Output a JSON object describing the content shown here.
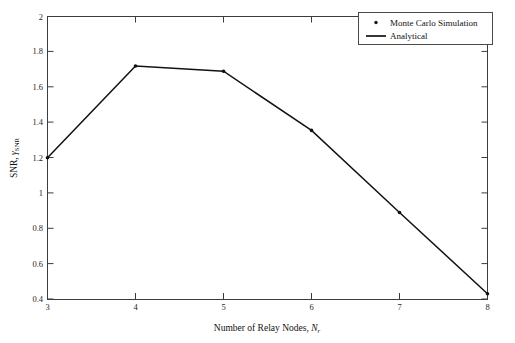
{
  "chart_data": {
    "type": "line",
    "title": "",
    "xlabel": "Number of Relay Nodes, N_r",
    "xlabel_main": "Number of Relay Nodes, ",
    "xlabel_symbol": "N",
    "xlabel_symbol_sub": "r",
    "ylabel": "SNR, γ_SNR",
    "ylabel_main": "SNR, ",
    "ylabel_symbol": "γ",
    "ylabel_symbol_sub": "SNR",
    "x": [
      3,
      4,
      5,
      6,
      7,
      8
    ],
    "xlim": [
      3,
      8
    ],
    "ylim": [
      0.4,
      2
    ],
    "xticks": [
      "3",
      "4",
      "5",
      "6",
      "7",
      "8"
    ],
    "yticks": [
      "0.4",
      "0.6",
      "0.8",
      "1",
      "1.2",
      "1.4",
      "1.6",
      "1.8",
      "2"
    ],
    "ytick_values": [
      0.4,
      0.6,
      0.8,
      1.0,
      1.2,
      1.4,
      1.6,
      1.8,
      2.0
    ],
    "grid": false,
    "legend_position": "top-right",
    "series": [
      {
        "name": "Monte Carlo Simulation",
        "style": "marker",
        "marker": "dot",
        "color": "#111111",
        "values": [
          1.2,
          1.72,
          1.69,
          1.355,
          0.89,
          0.43
        ]
      },
      {
        "name": "Analytical",
        "style": "line",
        "color": "#121212",
        "values": [
          1.2,
          1.72,
          1.69,
          1.355,
          0.89,
          0.43
        ]
      }
    ]
  },
  "legend": {
    "items": [
      {
        "label": "Monte Carlo Simulation",
        "marker": "dot-marker-icon"
      },
      {
        "label": "Analytical",
        "marker": "line-marker-icon"
      }
    ]
  },
  "colors": {
    "background": "#ffffff",
    "axis": "#3c3c3c",
    "data": "#121212",
    "text": "#111111"
  }
}
